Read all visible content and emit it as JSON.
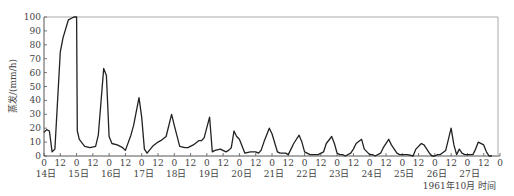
{
  "chart_data": {
    "type": "line",
    "title": "",
    "ylabel": "蒸发/(mm/h)",
    "xlabel": "1961年10月  时间",
    "ylim": [
      0,
      100
    ],
    "yticks": [
      0,
      10,
      20,
      30,
      40,
      50,
      60,
      70,
      80,
      90,
      100
    ],
    "xlim_hours": [
      0,
      336
    ],
    "x_tick_labels": [
      "0",
      "12",
      "0",
      "12",
      "0",
      "12",
      "0",
      "12",
      "0",
      "12",
      "0",
      "12",
      "0",
      "12",
      "0",
      "12",
      "0",
      "12",
      "0",
      "12",
      "0",
      "12",
      "0",
      "12",
      "0",
      "12",
      "0",
      "12",
      "0"
    ],
    "day_labels": [
      "14日",
      "15日",
      "16日",
      "17日",
      "18日",
      "19日",
      "20日",
      "21日",
      "22日",
      "23日",
      "24日",
      "25日",
      "26日",
      "27日"
    ],
    "grid": false,
    "legend": null,
    "series": [
      {
        "name": "蒸发",
        "x_hours": [
          0,
          2,
          4,
          6,
          8,
          10,
          12,
          14,
          18,
          22,
          24,
          24.5,
          26,
          30,
          34,
          38,
          40,
          44,
          46,
          48,
          50,
          54,
          58,
          60,
          64,
          66,
          70,
          72,
          74,
          76,
          80,
          84,
          86,
          90,
          94,
          96,
          100,
          104,
          106,
          110,
          114,
          116,
          118,
          122,
          124,
          126,
          130,
          134,
          136,
          138,
          140,
          142,
          144,
          148,
          152,
          154,
          156,
          158,
          160,
          162,
          166,
          168,
          172,
          174,
          176,
          178,
          180,
          182,
          184,
          188,
          190,
          192,
          196,
          200,
          202,
          206,
          208,
          212,
          214,
          216,
          218,
          220,
          222,
          226,
          228,
          230,
          234,
          236,
          240,
          242,
          244,
          248,
          250,
          254,
          256,
          260,
          262,
          264,
          268,
          272,
          274,
          278,
          280,
          284,
          286,
          288,
          290,
          292,
          296,
          298,
          300,
          302,
          304,
          306,
          308,
          310,
          314,
          316,
          318,
          320,
          324,
          326,
          328,
          330
        ],
        "values": [
          17,
          19,
          18,
          3,
          5,
          40,
          75,
          85,
          98,
          100,
          100,
          18,
          12,
          7,
          6,
          7,
          15,
          63,
          58,
          14,
          9,
          8,
          6,
          4,
          15,
          22,
          42,
          28,
          5,
          2,
          7,
          10,
          11,
          14,
          30,
          22,
          7,
          6,
          6,
          8,
          11,
          11,
          13,
          28,
          3,
          4,
          5,
          3,
          4,
          6,
          18,
          14,
          12,
          2,
          3,
          3,
          3,
          2,
          4,
          10,
          20,
          16,
          3,
          2,
          2,
          2,
          1,
          5,
          9,
          15,
          10,
          3,
          1,
          1,
          1,
          3,
          9,
          14,
          9,
          2,
          1,
          1,
          0,
          2,
          5,
          9,
          12,
          5,
          1,
          1,
          0,
          2,
          6,
          12,
          8,
          2,
          1,
          1,
          1,
          0,
          5,
          9,
          8,
          2,
          0,
          0,
          1,
          1,
          4,
          12,
          20,
          8,
          1,
          5,
          2,
          1,
          1,
          1,
          5,
          10,
          8,
          3,
          0,
          0
        ]
      }
    ]
  },
  "axes": {
    "y_title": "蒸发/(mm/h)",
    "x_title": "1961年10月  时间"
  }
}
